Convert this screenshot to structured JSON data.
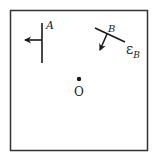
{
  "diagram": {
    "frame": {
      "x": 10,
      "y": 10,
      "width": 137,
      "height": 140,
      "stroke": "#333333"
    },
    "origin": {
      "label": "O",
      "x": 79,
      "y": 79
    },
    "element_a": {
      "label": "A",
      "line": {
        "x1": 42,
        "y1": 23,
        "x2": 42,
        "y2": 63
      },
      "arrow": {
        "x1": 42,
        "y1": 40,
        "x2": 23,
        "y2": 40,
        "direction": "left"
      }
    },
    "element_b": {
      "label": "B",
      "field_label": "ε",
      "field_subscript": "B",
      "line": {
        "x1": 95,
        "y1": 28,
        "x2": 125,
        "y2": 42
      },
      "arrow": {
        "x1": 107,
        "y1": 34,
        "x2": 99,
        "y2": 52,
        "direction": "down-left"
      }
    },
    "ink_color": "#1a1a1a"
  }
}
